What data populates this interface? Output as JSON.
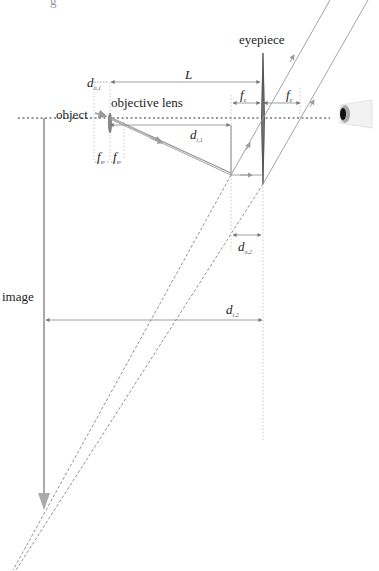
{
  "diagram": {
    "type": "optical ray diagram",
    "top_fragment": "g",
    "labels": {
      "object": "object",
      "objective_lens": "objective lens",
      "eyepiece": "eyepiece",
      "image": "image"
    },
    "symbols": {
      "L": {
        "base": "L",
        "sub": ""
      },
      "d_o1": {
        "base": "d",
        "sub": "o,1"
      },
      "d_i1": {
        "base": "d",
        "sub": "i,1"
      },
      "d_o2": {
        "base": "d",
        "sub": "o,2"
      },
      "d_i2": {
        "base": "d",
        "sub": "i,2"
      },
      "f_o_left": {
        "base": "f",
        "sub": "o"
      },
      "f_o_right": {
        "base": "f",
        "sub": "o"
      },
      "f_e_left": {
        "base": "f",
        "sub": "e"
      },
      "f_e_right": {
        "base": "f",
        "sub": "e"
      }
    },
    "elements": [
      "optical axis (dotted)",
      "objective lens",
      "eyepiece lens",
      "eye",
      "object arrow",
      "intermediate image",
      "final virtual image arrow",
      "parallel output rays",
      "dashed back-extended rays"
    ],
    "colors": {
      "ray": "#8a8a8a",
      "lens": "#555555",
      "axis": "#333333",
      "image_arrow": "#aaaaaa",
      "text": "#222222"
    }
  }
}
